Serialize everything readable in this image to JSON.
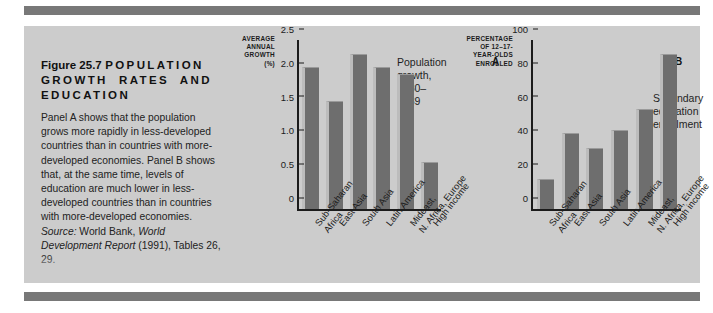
{
  "figure": {
    "label": "Figure 25.7",
    "title_line1": "POPULATION",
    "title_line2": "GROWTH   RATES   AND",
    "title_line3": "EDUCATION",
    "caption": "Panel A shows that the population grows more rapidly in less-developed countries than in countries with more-developed economies. Panel B shows that, at the same time, levels of education are much lower in less-developed countries than in countries with more-developed economies. ",
    "source_label": "Source:",
    "source_text": " World Bank, ",
    "source_italic": "World Development Report",
    "source_tail": " (1991), Tables 26, 29."
  },
  "colors": {
    "page_background": "#ffffff",
    "figure_background": "#cccccc",
    "rule": "#787878",
    "bar_fill": "#6e6e6e",
    "bar_highlight": "#bcbcbc",
    "axis": "#1b1b1b",
    "text": "#1b1b1b"
  },
  "chart_data": [
    {
      "type": "bar",
      "panel": "A",
      "title": "Population growth, 1980–1989",
      "title_line1": "Population",
      "title_line2": "growth,",
      "title_line3": "1980–1989",
      "ylabel": "AVERAGE ANNUAL GROWTH (%)",
      "ylabel_line1": "AVERAGE",
      "ylabel_line2": "ANNUAL",
      "ylabel_line3": "GROWTH",
      "ylabel_line4": "(%)",
      "xlabel": "",
      "ylim": [
        0,
        2.5
      ],
      "yticks": [
        "0",
        "0.5",
        "1.0",
        "1.5",
        "2.0",
        "2.5"
      ],
      "ytick_values": [
        0,
        0.5,
        1.0,
        1.5,
        2.0,
        2.5
      ],
      "grid": false,
      "legend": "none",
      "categories": [
        "Sub-Saharan Africa",
        "East Asia",
        "South Asia",
        "Latin America",
        "Mideast, N. Africa, Europe",
        "High income"
      ],
      "category_lines": [
        [
          "Sub-Saharan",
          "Africa"
        ],
        [
          "East Asia"
        ],
        [
          "South Asia"
        ],
        [
          "Latin America"
        ],
        [
          "Mideast,",
          "N. Africa, Europe"
        ],
        [
          "High income"
        ]
      ],
      "values": [
        2.1,
        1.6,
        2.3,
        2.1,
        2.0,
        0.7
      ]
    },
    {
      "type": "bar",
      "panel": "B",
      "title": "Secondary education enrollment",
      "title_line1": "Secondary",
      "title_line2": "education",
      "title_line3": "enrollment",
      "ylabel": "PERCENTAGE OF 12-17-YEAR-OLDS ENROLLED",
      "ylabel_line1": "PERCENTAGE",
      "ylabel_line2": "OF 12–17-",
      "ylabel_line3": "YEAR-OLDS",
      "ylabel_line4": "ENROLLED",
      "xlabel": "",
      "ylim": [
        0,
        100
      ],
      "yticks": [
        "0",
        "20",
        "40",
        "60",
        "80",
        "100"
      ],
      "ytick_values": [
        0,
        20,
        40,
        60,
        80,
        100
      ],
      "grid": false,
      "legend": "none",
      "categories": [
        "Sub-Saharan Africa",
        "East Asia",
        "South Asia",
        "Latin America",
        "Mideast, N. Africa, Europe",
        "High income"
      ],
      "category_lines": [
        [
          "Sub-Saharan",
          "Africa"
        ],
        [
          "East Asia"
        ],
        [
          "South Asia"
        ],
        [
          "Latin America"
        ],
        [
          "Mideast,",
          "N. Africa, Europe"
        ],
        [
          "High income"
        ]
      ],
      "values": [
        18,
        45,
        36,
        47,
        59,
        92
      ]
    }
  ]
}
